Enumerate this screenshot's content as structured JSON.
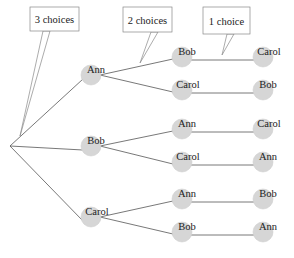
{
  "diagram": {
    "type": "tree",
    "callouts": [
      {
        "label": "3 choices",
        "box": [
          30,
          7,
          49,
          24
        ],
        "pointer": [
          [
            43,
            31
          ],
          [
            50,
            31
          ],
          [
            20,
            136
          ],
          [
            43,
            31
          ]
        ]
      },
      {
        "label": "2 choices",
        "box": [
          123,
          7,
          49,
          25
        ],
        "pointer": [
          [
            151,
            32
          ],
          [
            158,
            32
          ],
          [
            140,
            63
          ],
          [
            151,
            32
          ]
        ]
      },
      {
        "label": "1 choice",
        "box": [
          203,
          7,
          47,
          27
        ],
        "pointer": [
          [
            227,
            34
          ],
          [
            234,
            34
          ],
          [
            222,
            55
          ],
          [
            227,
            34
          ]
        ]
      }
    ],
    "root": {
      "x": 10,
      "y": 146
    },
    "level1": [
      {
        "label": "Ann",
        "x": 91,
        "y": 75
      },
      {
        "label": "Bob",
        "x": 91,
        "y": 146
      },
      {
        "label": "Carol",
        "x": 91,
        "y": 217
      }
    ],
    "level2": [
      {
        "label": "Bob",
        "parent": 0,
        "x": 182,
        "y": 57
      },
      {
        "label": "Carol",
        "parent": 0,
        "x": 182,
        "y": 90
      },
      {
        "label": "Ann",
        "parent": 1,
        "x": 182,
        "y": 129
      },
      {
        "label": "Carol",
        "parent": 1,
        "x": 182,
        "y": 162
      },
      {
        "label": "Ann",
        "parent": 2,
        "x": 182,
        "y": 199
      },
      {
        "label": "Bob",
        "parent": 2,
        "x": 182,
        "y": 232
      }
    ],
    "level3": [
      {
        "label": "Carol",
        "x": 263,
        "y": 57
      },
      {
        "label": "Bob",
        "x": 263,
        "y": 90
      },
      {
        "label": "Carol",
        "x": 263,
        "y": 129
      },
      {
        "label": "Ann",
        "x": 263,
        "y": 162
      },
      {
        "label": "Bob",
        "x": 263,
        "y": 199
      },
      {
        "label": "Ann",
        "x": 263,
        "y": 232
      }
    ],
    "colors": {
      "node_fill": "#d6d6d6",
      "node_stroke": "#cfcfcf",
      "line": "#555555",
      "callout_stroke": "#888888"
    }
  }
}
